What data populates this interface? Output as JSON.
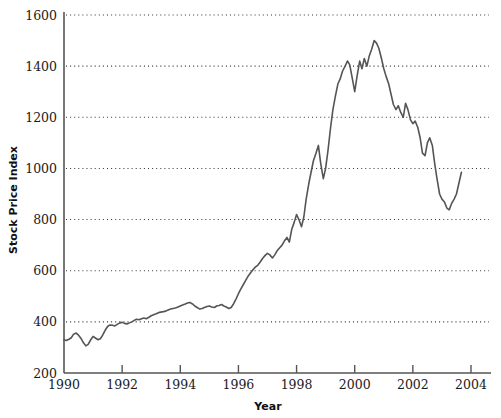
{
  "chart_data": {
    "type": "line",
    "title": "",
    "subtitle": "",
    "xlabel": "Year",
    "ylabel": "Stock Price Index",
    "xlim": [
      1990,
      2004
    ],
    "ylim": [
      200,
      1600
    ],
    "xticks": [
      1990,
      1992,
      1994,
      1996,
      1998,
      2000,
      2002,
      2004
    ],
    "xtick_labels": [
      "1990",
      "1992",
      "1994",
      "1996",
      "1998",
      "2000",
      "2002",
      "2004"
    ],
    "yticks": [
      200,
      400,
      600,
      800,
      1000,
      1200,
      1400,
      1600
    ],
    "ytick_labels": [
      "200",
      "400",
      "600",
      "800",
      "1000",
      "1200",
      "1400",
      "1600"
    ],
    "grid": "horizontal-dotted",
    "legend": "none",
    "line_color": "#555555",
    "axis_color": "#555555",
    "grid_color": "#333333",
    "series": [
      {
        "name": "Stock Price Index",
        "x": [
          1990.0,
          1990.08,
          1990.17,
          1990.25,
          1990.33,
          1990.42,
          1990.5,
          1990.58,
          1990.67,
          1990.75,
          1990.83,
          1990.92,
          1991.0,
          1991.08,
          1991.17,
          1991.25,
          1991.33,
          1991.42,
          1991.5,
          1991.58,
          1991.67,
          1991.75,
          1991.83,
          1991.92,
          1992.0,
          1992.08,
          1992.17,
          1992.25,
          1992.33,
          1992.42,
          1992.5,
          1992.58,
          1992.67,
          1992.75,
          1992.83,
          1992.92,
          1993.0,
          1993.08,
          1993.17,
          1993.25,
          1993.33,
          1993.42,
          1993.5,
          1993.58,
          1993.67,
          1993.75,
          1993.83,
          1993.92,
          1994.0,
          1994.08,
          1994.17,
          1994.25,
          1994.33,
          1994.42,
          1994.5,
          1994.58,
          1994.67,
          1994.75,
          1994.83,
          1994.92,
          1995.0,
          1995.08,
          1995.17,
          1995.25,
          1995.33,
          1995.42,
          1995.5,
          1995.58,
          1995.67,
          1995.75,
          1995.83,
          1995.92,
          1996.0,
          1996.08,
          1996.17,
          1996.25,
          1996.33,
          1996.42,
          1996.5,
          1996.58,
          1996.67,
          1996.75,
          1996.83,
          1996.92,
          1997.0,
          1997.08,
          1997.17,
          1997.25,
          1997.33,
          1997.42,
          1997.5,
          1997.58,
          1997.67,
          1997.75,
          1997.83,
          1997.92,
          1998.0,
          1998.08,
          1998.17,
          1998.25,
          1998.33,
          1998.42,
          1998.5,
          1998.58,
          1998.67,
          1998.75,
          1998.83,
          1998.92,
          1999.0,
          1999.08,
          1999.17,
          1999.25,
          1999.33,
          1999.42,
          1999.5,
          1999.58,
          1999.67,
          1999.75,
          1999.83,
          1999.92,
          2000.0,
          2000.08,
          2000.17,
          2000.25,
          2000.33,
          2000.42,
          2000.5,
          2000.58,
          2000.67,
          2000.75,
          2000.83,
          2000.92,
          2001.0,
          2001.08,
          2001.17,
          2001.25,
          2001.33,
          2001.42,
          2001.5,
          2001.58,
          2001.67,
          2001.75,
          2001.83,
          2001.92,
          2002.0,
          2002.08,
          2002.17,
          2002.25,
          2002.33,
          2002.42,
          2002.5,
          2002.58,
          2002.67,
          2002.75,
          2002.83,
          2002.92,
          2003.0,
          2003.08,
          2003.17,
          2003.25,
          2003.33,
          2003.42,
          2003.5,
          2003.58,
          2003.67
        ],
        "values": [
          330,
          327,
          332,
          338,
          352,
          356,
          348,
          336,
          318,
          306,
          312,
          330,
          343,
          337,
          330,
          334,
          348,
          368,
          382,
          388,
          387,
          384,
          390,
          396,
          398,
          394,
          392,
          396,
          400,
          406,
          410,
          408,
          412,
          415,
          412,
          418,
          424,
          428,
          432,
          436,
          438,
          440,
          442,
          446,
          450,
          452,
          454,
          458,
          462,
          466,
          470,
          474,
          476,
          470,
          462,
          456,
          450,
          452,
          456,
          460,
          462,
          458,
          456,
          462,
          464,
          468,
          462,
          458,
          452,
          456,
          470,
          490,
          510,
          528,
          546,
          562,
          578,
          592,
          604,
          614,
          622,
          634,
          648,
          660,
          668,
          662,
          650,
          662,
          678,
          690,
          700,
          716,
          730,
          712,
          760,
          790,
          820,
          800,
          772,
          810,
          880,
          940,
          986,
          1030,
          1060,
          1090,
          1020,
          960,
          1000,
          1070,
          1160,
          1230,
          1280,
          1330,
          1350,
          1380,
          1400,
          1420,
          1405,
          1350,
          1300,
          1360,
          1420,
          1390,
          1430,
          1400,
          1440,
          1465,
          1500,
          1490,
          1470,
          1430,
          1390,
          1360,
          1330,
          1290,
          1250,
          1230,
          1245,
          1220,
          1200,
          1255,
          1230,
          1190,
          1175,
          1185,
          1160,
          1120,
          1060,
          1050,
          1100,
          1120,
          1090,
          1020,
          960,
          900,
          880,
          870,
          845,
          838,
          862,
          880,
          900,
          940,
          985
        ]
      }
    ]
  },
  "axis_titles": {
    "y": "Stock Price Index",
    "x": "Year"
  }
}
